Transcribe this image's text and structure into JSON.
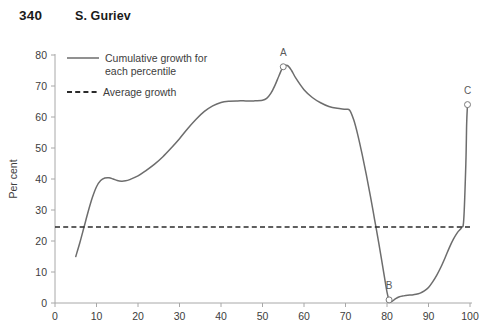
{
  "running_head": {
    "page_number": "340",
    "title": "S. Guriev"
  },
  "chart_data": {
    "type": "line",
    "title": "",
    "xlabel": "",
    "ylabel": "Per cent",
    "xlim": [
      0,
      100
    ],
    "ylim": [
      0,
      80
    ],
    "grid": false,
    "xticks": [
      0,
      10,
      20,
      30,
      40,
      50,
      60,
      70,
      80,
      90,
      100
    ],
    "yticks": [
      0,
      10,
      20,
      30,
      40,
      50,
      60,
      70,
      80
    ],
    "xtick_labels": [
      "0",
      "10",
      "20",
      "30",
      "40",
      "50",
      "60",
      "70",
      "80",
      "90",
      "100"
    ],
    "ytick_labels": [
      "0",
      "10",
      "20",
      "30",
      "40",
      "50",
      "60",
      "70",
      "80"
    ],
    "legend": {
      "position": "top-left",
      "entries": [
        {
          "label": "Cumulative growth for each percentile",
          "style": "solid",
          "color": "#6d6d6d"
        },
        {
          "label": "Average growth",
          "style": "dashed",
          "color": "#2b2b2b"
        }
      ]
    },
    "series": [
      {
        "name": "Cumulative growth for each percentile",
        "style": "solid",
        "color": "#6d6d6d",
        "x": [
          5,
          6,
          7,
          8,
          9,
          10,
          11,
          12,
          13,
          14,
          15,
          16,
          17,
          18,
          20,
          22,
          24,
          26,
          28,
          30,
          32,
          34,
          36,
          38,
          40,
          42,
          44,
          46,
          48,
          50,
          51,
          52,
          53,
          54,
          55,
          56,
          57,
          58,
          60,
          62,
          64,
          66,
          68,
          70,
          71,
          72,
          73,
          74,
          75,
          76,
          77,
          78,
          79,
          80,
          80.5,
          81,
          82,
          83,
          84,
          85,
          86,
          87,
          88,
          89,
          90,
          91,
          92,
          93,
          94,
          95,
          96,
          97,
          98,
          98.5,
          99,
          99.2,
          99.4
        ],
        "y": [
          15.0,
          19.5,
          24.5,
          29.5,
          34.0,
          37.5,
          39.5,
          40.3,
          40.4,
          40.0,
          39.5,
          39.3,
          39.4,
          39.8,
          41.0,
          42.8,
          44.8,
          47.2,
          50.0,
          53.0,
          56.3,
          59.3,
          61.8,
          63.6,
          64.7,
          65.1,
          65.2,
          65.2,
          65.2,
          65.4,
          66.0,
          67.6,
          70.2,
          73.4,
          76.2,
          76.6,
          75.0,
          72.6,
          68.8,
          66.3,
          64.6,
          63.4,
          62.8,
          62.5,
          62.2,
          59.0,
          54.0,
          48.0,
          41.5,
          34.5,
          27.0,
          19.5,
          11.5,
          3.5,
          1.0,
          0.4,
          1.3,
          2.0,
          2.3,
          2.5,
          2.6,
          2.8,
          3.2,
          3.9,
          5.0,
          6.8,
          9.0,
          11.6,
          14.6,
          17.8,
          20.6,
          22.8,
          24.4,
          27.0,
          45.0,
          58.0,
          64.0
        ]
      },
      {
        "name": "Average growth",
        "style": "dashed",
        "color": "#2b2b2b",
        "x": [
          0,
          100
        ],
        "y": [
          24.5,
          24.5
        ],
        "value": 24.5
      }
    ],
    "annotations": [
      {
        "label": "A",
        "x": 55,
        "y": 76.2,
        "marker": "open-circle",
        "label_dy": -11
      },
      {
        "label": "B",
        "x": 80.5,
        "y": 1.0,
        "marker": "open-circle",
        "label_dy": -11
      },
      {
        "label": "C",
        "x": 99.4,
        "y": 64.0,
        "marker": "open-circle",
        "label_dy": -11
      }
    ]
  }
}
